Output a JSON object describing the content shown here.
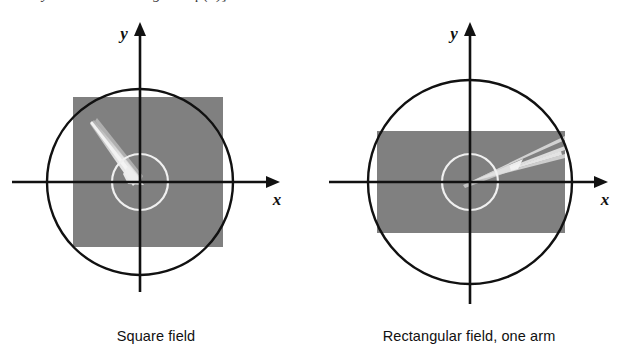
{
  "page": {
    "background_color": "#ffffff",
    "width": 625,
    "height": 360,
    "cut_off_text_line": "y = -0.5 according to Eq.(5)]"
  },
  "colors": {
    "field_gray": "#808080",
    "outline_black": "#111111",
    "inner_circle_white": "#f0f0f0",
    "track_white": "#e8e8e8",
    "background": "#ffffff"
  },
  "panels": [
    {
      "id": "square-field",
      "caption": "Square field",
      "axes": {
        "x_label": "x",
        "y_label": "y"
      },
      "geometry": {
        "center_x": 140,
        "center_y": 168,
        "outer_circle_radius": 93,
        "inner_circle_radius": 28,
        "field_shape": "square",
        "field_left": 73,
        "field_top": 83,
        "field_width": 150,
        "field_height": 150
      },
      "tracks": {
        "count": 1,
        "direction": "upper-left-to-center",
        "description": "single broad track entering from upper left"
      }
    },
    {
      "id": "rectangular-field-one-arm",
      "caption": "Rectangular field, one arm",
      "axes": {
        "x_label": "x",
        "y_label": "y"
      },
      "geometry": {
        "center_x": 157,
        "center_y": 168,
        "outer_circle_radius": 102,
        "inner_circle_radius": 28,
        "field_shape": "rectangle",
        "field_left": 64,
        "field_top": 117,
        "field_width": 188,
        "field_height": 102
      },
      "tracks": {
        "count": 5,
        "direction": "center-to-upper-right",
        "description": "fan of thin tracks radiating to the upper right"
      }
    }
  ]
}
